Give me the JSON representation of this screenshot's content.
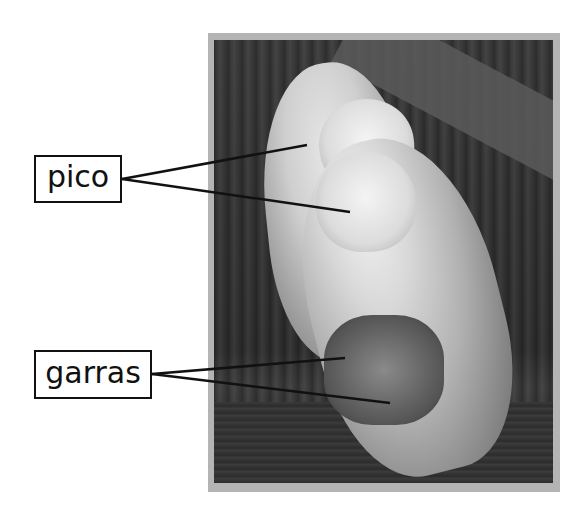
{
  "figure": {
    "photo_style": "grayscale",
    "frame_color": "#b4b4b4"
  },
  "labels": [
    {
      "id": "pico",
      "text": "pico",
      "box": {
        "x": 34,
        "y": 155,
        "width": 88,
        "height": 48
      },
      "leaders": [
        {
          "from": [
            122,
            179
          ],
          "to": [
            307,
            145
          ]
        },
        {
          "from": [
            122,
            179
          ],
          "to": [
            350,
            212
          ]
        }
      ]
    },
    {
      "id": "garras",
      "text": "garras",
      "box": {
        "x": 34,
        "y": 350,
        "width": 118,
        "height": 49
      },
      "leaders": [
        {
          "from": [
            152,
            374
          ],
          "to": [
            345,
            358
          ]
        },
        {
          "from": [
            152,
            374
          ],
          "to": [
            390,
            403
          ]
        }
      ]
    }
  ]
}
